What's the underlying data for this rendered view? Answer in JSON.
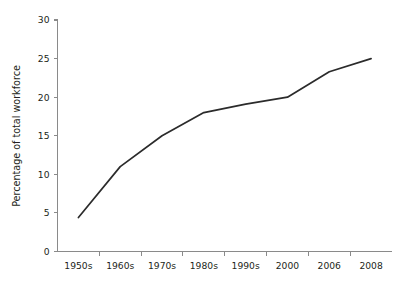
{
  "chart_data": {
    "type": "line",
    "title": "",
    "subtitle": "",
    "xlabel": "",
    "ylabel": "Percentage of total workforce",
    "categories": [
      "1950s",
      "1960s",
      "1970s",
      "1980s",
      "1990s",
      "2000",
      "2006",
      "2008"
    ],
    "values": [
      4.4,
      11,
      15,
      18,
      19.1,
      20,
      23.3,
      25
    ],
    "series": [
      {
        "name": "Percentage of total workforce",
        "values": [
          4.4,
          11,
          15,
          18,
          19.1,
          20,
          23.3,
          25
        ],
        "color": "#2b2b2b"
      }
    ],
    "ylim": [
      0,
      30
    ],
    "ytick_values": [
      0,
      5,
      10,
      15,
      20,
      25,
      30
    ],
    "ytick_labels": [
      "0",
      "5",
      "10",
      "15",
      "20",
      "25",
      "30"
    ],
    "grid": false,
    "legend": false,
    "legend_position": "none",
    "annotations": []
  },
  "style": {
    "background_color": "#ffffff",
    "axis_color": "#8a8a8a",
    "line_color": "#2b2b2b",
    "text_color": "#231f20"
  }
}
